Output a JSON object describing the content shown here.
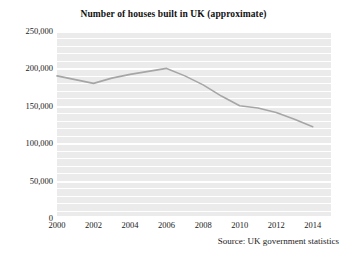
{
  "chart_data": {
    "type": "line",
    "title": "Number of houses built in UK (approximate)",
    "subtitle": "",
    "xlabel": "",
    "ylabel": "",
    "source_note": "Source: UK government statistics",
    "x": [
      2000,
      2001,
      2002,
      2003,
      2004,
      2005,
      2006,
      2007,
      2008,
      2009,
      2010,
      2011,
      2012,
      2013,
      2014
    ],
    "series": [
      {
        "name": "Houses built",
        "color": "#a6a6a6",
        "values": [
          190000,
          185000,
          180000,
          187000,
          192000,
          196000,
          200000,
          190000,
          178000,
          163000,
          150000,
          147000,
          141000,
          132000,
          122000
        ]
      }
    ],
    "xlim": [
      2000,
      2015
    ],
    "ylim": [
      0,
      250000
    ],
    "ytick_values": [
      0,
      50000,
      100000,
      150000,
      200000,
      250000
    ],
    "ytick_labels": [
      "0",
      "50,000",
      "100,000",
      "150,000",
      "200,000",
      "250,000"
    ],
    "xtick_values": [
      2000,
      2002,
      2004,
      2006,
      2008,
      2010,
      2012,
      2014
    ],
    "xtick_labels": [
      "2000",
      "2002",
      "2004",
      "2006",
      "2008",
      "2010",
      "2012",
      "2014"
    ],
    "grid": {
      "horizontal": true,
      "vertical": false,
      "minor_step": 10000,
      "gridline_color": "#ffffff",
      "plot_background": "#ebebeb"
    },
    "legend": {
      "visible": false,
      "position": "none"
    }
  }
}
